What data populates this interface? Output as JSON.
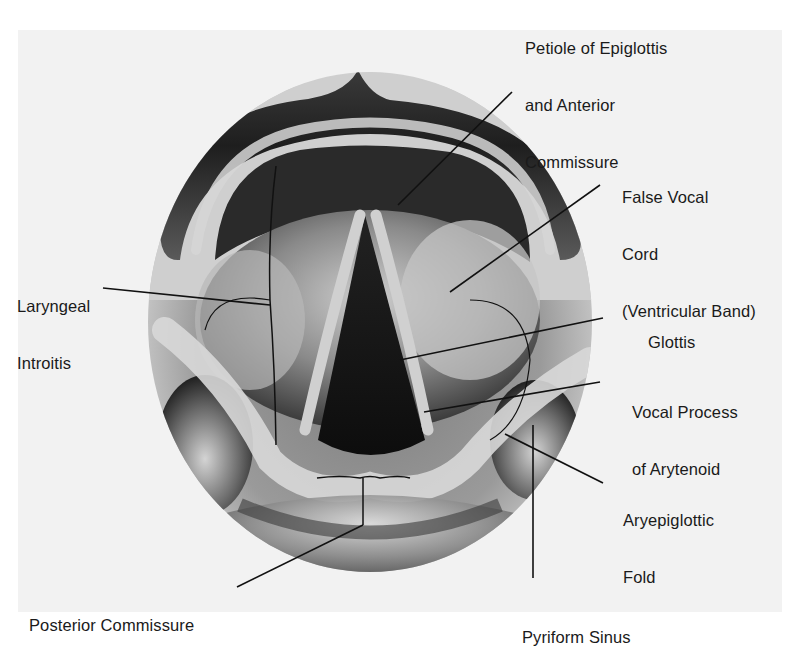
{
  "figure": {
    "colors": {
      "background": "#ffffff",
      "panel": "#f2f2f2",
      "ink": "#1a1a1a",
      "tissue_light": "#d8d8d8",
      "tissue_dark": "#2a2a2a"
    }
  },
  "labels": {
    "petiole": {
      "lines": [
        "Petiole of Epiglottis",
        "and Anterior",
        "Commissure"
      ]
    },
    "false_cord": {
      "lines": [
        "False Vocal",
        "Cord",
        "(Ventricular Band)"
      ]
    },
    "laryngeal": {
      "lines": [
        "Laryngeal",
        "Introitis"
      ]
    },
    "glottis": {
      "lines": [
        "Glottis"
      ]
    },
    "vocal_process": {
      "lines": [
        "Vocal Process",
        "of Arytenoid"
      ]
    },
    "aryepiglottic": {
      "lines": [
        "Aryepiglottic",
        "Fold"
      ]
    },
    "posterior": {
      "lines": [
        "Posterior Commissure"
      ]
    },
    "pyriform": {
      "lines": [
        "Pyriform Sinus"
      ]
    }
  }
}
